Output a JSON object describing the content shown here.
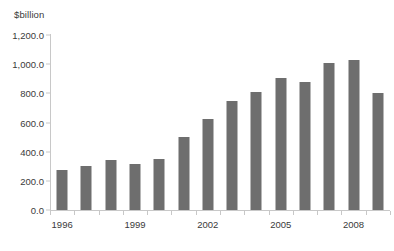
{
  "chart_data": {
    "type": "bar",
    "title": "",
    "subtitle": "",
    "xlabel": "",
    "ylabel": "$billion",
    "ylim": [
      0,
      1200
    ],
    "ytick_labels": [
      "1,200.0",
      "1,000.0",
      "800.0",
      "600.0",
      "400.0",
      "200.0",
      "0.0"
    ],
    "ytick_values": [
      1200,
      1000,
      800,
      600,
      400,
      200,
      0
    ],
    "grid": false,
    "legend": null,
    "bar_color": "#6e6e6e",
    "axis_color": "#c8c8c8",
    "text_color": "#3a3a3a",
    "categories": [
      1996,
      1997,
      1998,
      1999,
      2000,
      2001,
      2002,
      2003,
      2004,
      2005,
      2006,
      2007,
      2008,
      2009
    ],
    "xtick_labels_shown": [
      "1996",
      "1999",
      "2002",
      "2005",
      "2008"
    ],
    "values": [
      275,
      300,
      345,
      315,
      350,
      500,
      625,
      745,
      810,
      905,
      880,
      1005,
      1030,
      800
    ]
  }
}
